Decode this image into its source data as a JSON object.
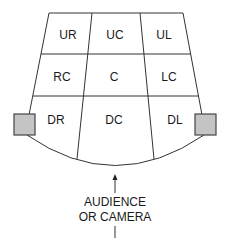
{
  "diagram": {
    "regions": {
      "upstage_right": "UR",
      "upstage_center": "UC",
      "upstage_left": "UL",
      "right_center": "RC",
      "center": "C",
      "left_center": "LC",
      "downstage_right": "DR",
      "downstage_center": "DC",
      "downstage_left": "DL"
    },
    "caption": {
      "line1": "AUDIENCE",
      "line2": "OR CAMERA"
    },
    "colors": {
      "lines": "#333333",
      "side_boxes": "#c4c4c4",
      "text": "#1a1a1a"
    }
  }
}
